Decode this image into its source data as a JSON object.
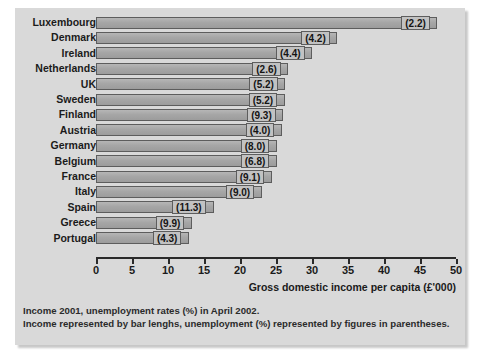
{
  "chart_data": {
    "type": "bar",
    "orientation": "horizontal",
    "title": "",
    "xlabel": "Gross domestic income per capita (£'000)",
    "ylabel": "",
    "xlim": [
      0,
      50
    ],
    "xticks": [
      0,
      5,
      10,
      15,
      20,
      25,
      30,
      35,
      40,
      45,
      50
    ],
    "grid": false,
    "legend": null,
    "categories": [
      "Luxembourg",
      "Denmark",
      "Ireland",
      "Netherlands",
      "UK",
      "Sweden",
      "Finland",
      "Austria",
      "Germany",
      "Belgium",
      "France",
      "Italy",
      "Spain",
      "Greece",
      "Portugal"
    ],
    "series": [
      {
        "name": "Gross domestic income per capita (£'000)",
        "values": [
          47.4,
          33.5,
          30.0,
          26.7,
          26.3,
          26.2,
          26.0,
          25.8,
          25.1,
          25.1,
          24.4,
          23.0,
          16.4,
          13.3,
          12.9
        ]
      },
      {
        "name": "Unemployment rate (%), April 2002",
        "values": [
          2.2,
          4.2,
          4.4,
          2.6,
          5.2,
          5.2,
          9.3,
          4.0,
          8.0,
          6.8,
          9.1,
          9.0,
          11.3,
          9.9,
          4.3
        ]
      }
    ],
    "data_labels": [
      "(2.2)",
      "(4.2)",
      "(4.4)",
      "(2.6)",
      "(5.2)",
      "(5.2)",
      "(9.3)",
      "(4.0)",
      "(8.0)",
      "(6.8)",
      "(9.1)",
      "(9.0)",
      "(11.3)",
      "(9.9)",
      "(4.3)"
    ],
    "caption_lines": [
      "Income 2001, unemployment rates (%) in April 2002.",
      "Income represented by bar lenghs, unemployment (%) represented by figures in parentheses."
    ],
    "colors": {
      "figure_background": "#d9d9d9",
      "bar_fill": "#a6a6a6",
      "bar_border": "#5d5d5d",
      "label_box_fill": "#c2c2c2",
      "axis": "#2a2a2a",
      "text": "#1b1b1b"
    }
  }
}
